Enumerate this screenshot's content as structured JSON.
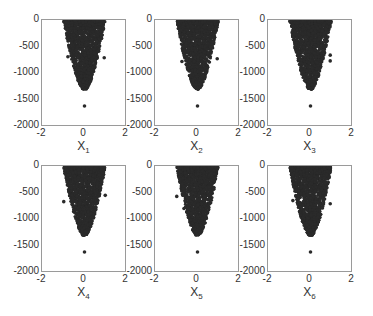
{
  "chart_data": [
    {
      "type": "scatter",
      "xlabel": "X_1",
      "ylabel": "",
      "xlim": [
        -2,
        2
      ],
      "ylim": [
        -2000,
        0
      ],
      "xticks": [
        -2,
        0,
        2
      ],
      "yticks": [
        0,
        -500,
        -1000,
        -1500,
        -2000
      ],
      "description": "Dense funnel of points, x spread ~[-1,1] near y=0 narrowing to ~0 at y≈-1300; outlier at (0,-1620)",
      "outliers": [
        {
          "x": 0.0,
          "y": -1620
        },
        {
          "x": 0.95,
          "y": -700
        },
        {
          "x": -0.8,
          "y": -680
        }
      ]
    },
    {
      "type": "scatter",
      "xlabel": "X_2",
      "ylabel": "",
      "xlim": [
        -2,
        2
      ],
      "ylim": [
        -2000,
        0
      ],
      "xticks": [
        -2,
        0,
        2
      ],
      "yticks": [
        0,
        -500,
        -1000,
        -1500,
        -2000
      ],
      "outliers": [
        {
          "x": 0.0,
          "y": -1620
        },
        {
          "x": -0.75,
          "y": -770
        },
        {
          "x": 0.95,
          "y": -720
        }
      ]
    },
    {
      "type": "scatter",
      "xlabel": "X_3",
      "ylabel": "",
      "xlim": [
        -2,
        2
      ],
      "ylim": [
        -2000,
        0
      ],
      "xticks": [
        -2,
        0,
        2
      ],
      "yticks": [
        0,
        -500,
        -1000,
        -1500,
        -2000
      ],
      "outliers": [
        {
          "x": 0.0,
          "y": -1620
        },
        {
          "x": 0.95,
          "y": -650
        },
        {
          "x": 0.95,
          "y": -760
        }
      ]
    },
    {
      "type": "scatter",
      "xlabel": "X_4",
      "ylabel": "",
      "xlim": [
        -2,
        2
      ],
      "ylim": [
        -2000,
        0
      ],
      "xticks": [
        -2,
        0,
        2
      ],
      "yticks": [
        0,
        -500,
        -1000,
        -1500,
        -2000
      ],
      "outliers": [
        {
          "x": 0.0,
          "y": -1620
        },
        {
          "x": -1.0,
          "y": -660
        },
        {
          "x": 1.0,
          "y": -540
        }
      ]
    },
    {
      "type": "scatter",
      "xlabel": "X_5",
      "ylabel": "",
      "xlim": [
        -2,
        2
      ],
      "ylim": [
        -2000,
        0
      ],
      "xticks": [
        -2,
        0,
        2
      ],
      "yticks": [
        0,
        -500,
        -1000,
        -1500,
        -2000
      ],
      "outliers": [
        {
          "x": 0.0,
          "y": -1620
        },
        {
          "x": -0.65,
          "y": -790
        },
        {
          "x": -1.0,
          "y": -560
        }
      ]
    },
    {
      "type": "scatter",
      "xlabel": "X_6",
      "ylabel": "",
      "xlim": [
        -2,
        2
      ],
      "ylim": [
        -2000,
        0
      ],
      "xticks": [
        -2,
        0,
        2
      ],
      "yticks": [
        0,
        -500,
        -1000,
        -1500,
        -2000
      ],
      "outliers": [
        {
          "x": 0.0,
          "y": -1620
        },
        {
          "x": 0.95,
          "y": -700
        },
        {
          "x": -0.85,
          "y": -640
        }
      ]
    }
  ],
  "panels": [
    {
      "label": "X",
      "sub": "1"
    },
    {
      "label": "X",
      "sub": "2"
    },
    {
      "label": "X",
      "sub": "3"
    },
    {
      "label": "X",
      "sub": "4"
    },
    {
      "label": "X",
      "sub": "5"
    },
    {
      "label": "X",
      "sub": "6"
    }
  ],
  "yticks": [
    "0",
    "-500",
    "-1000",
    "-1500",
    "-2000"
  ],
  "xticks": [
    "-2",
    "0",
    "2"
  ],
  "colors": {
    "points": "#2a2a2a",
    "axes": "#9a9a9a"
  }
}
